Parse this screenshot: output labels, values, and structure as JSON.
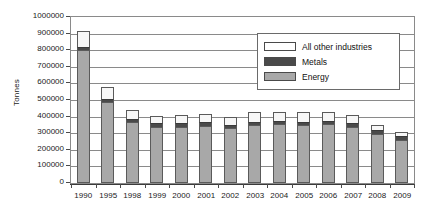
{
  "chart_data": {
    "type": "bar",
    "stacked": true,
    "title": "",
    "xlabel": "",
    "ylabel": "Tonnes",
    "ylim": [
      0,
      1000000
    ],
    "ytick_step": 100000,
    "grid": true,
    "legend_position": "top-right",
    "categories": [
      "1990",
      "1995",
      "1998",
      "1999",
      "2000",
      "2001",
      "2002",
      "2003",
      "2004",
      "2005",
      "2006",
      "2007",
      "2008",
      "2009"
    ],
    "ytick_labels": [
      "1000000",
      "900000",
      "800000",
      "700000",
      "600000",
      "500000",
      "400000",
      "300000",
      "200000",
      "100000",
      "0"
    ],
    "series": [
      {
        "name": "Energy",
        "color": "#a8a8a8",
        "values": [
          800000,
          490000,
          365000,
          340000,
          340000,
          345000,
          330000,
          350000,
          355000,
          350000,
          355000,
          340000,
          295000,
          260000
        ]
      },
      {
        "name": "Metals",
        "color": "#4a4a4a",
        "values": [
          20000,
          15000,
          20000,
          20000,
          20000,
          20000,
          20000,
          20000,
          20000,
          20000,
          20000,
          20000,
          25000,
          25000
        ]
      },
      {
        "name": "All other industries",
        "color": "#ffffff",
        "values": [
          95000,
          75000,
          55000,
          45000,
          50000,
          50000,
          50000,
          55000,
          55000,
          55000,
          55000,
          50000,
          30000,
          25000
        ]
      }
    ],
    "totals": [
      915000,
      580000,
      440000,
      405000,
      410000,
      415000,
      400000,
      425000,
      430000,
      425000,
      430000,
      410000,
      350000,
      310000
    ]
  },
  "legend": {
    "items": [
      {
        "label": "All other industries",
        "swatch": "legend-swatch-all-other-industries"
      },
      {
        "label": "Metals",
        "swatch": "legend-swatch-metals"
      },
      {
        "label": "Energy",
        "swatch": "legend-swatch-energy"
      }
    ]
  }
}
